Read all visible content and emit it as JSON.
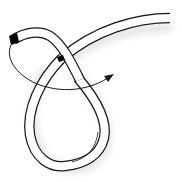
{
  "diagram": {
    "colors": {
      "background": "#ffffff",
      "rope_fill": "#ffffff",
      "rope_outline": "#1a1a1a",
      "rope_end_tip": "#000000",
      "shadow": "#e6e6e6",
      "arrow": "#1a1a1a"
    },
    "elements": [
      {
        "id": "standing-part",
        "description": "rope leading off to the upper right"
      },
      {
        "id": "loop",
        "description": "teardrop-shaped loop at bottom"
      },
      {
        "id": "working-end",
        "description": "rope end with black tip at upper left"
      },
      {
        "id": "direction-arrow",
        "description": "curved arrow showing the working end passing behind and out to the right"
      }
    ]
  }
}
